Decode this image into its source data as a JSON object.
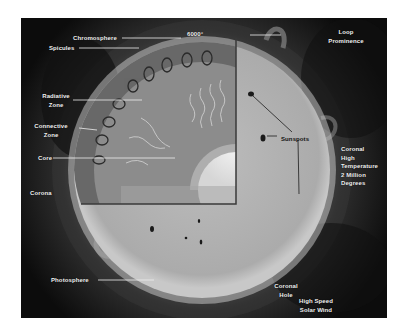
{
  "diagram": {
    "labels": {
      "chromosphere": "Chromosphere",
      "temperature_top": "6000°",
      "loop_prominence_1": "Loop",
      "loop_prominence_2": "Prominence",
      "spicules": "Spicules",
      "radiative_zone_1": "Radiative",
      "radiative_zone_2": "Zone",
      "convective_zone_1": "Connective",
      "convective_zone_2": "Zone",
      "core": "Core",
      "sunspots": "Sunspots",
      "coronal_high_1": "Coronal",
      "coronal_high_2": "High",
      "coronal_high_3": "Temperature",
      "coronal_high_4": "2 Million",
      "coronal_high_5": "Degrees",
      "corona": "Corona",
      "photosphere": "Photosphere",
      "coronal_hole_1": "Coronal",
      "coronal_hole_2": "Hole",
      "solar_wind_1": "High Speed",
      "solar_wind_2": "Solar Wind"
    },
    "colors": {
      "background": "#0c0c0c",
      "sun_surface": "#b4b4b4",
      "convective_zone": "#6e6e6e",
      "radiative_zone": "#8a8a8a",
      "core": "#e6e6e6",
      "label_text": "#f2f2f2"
    }
  }
}
